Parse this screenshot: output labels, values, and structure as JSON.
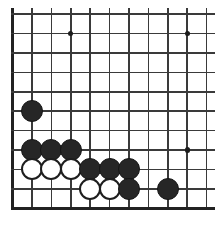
{
  "figure": {
    "width": 215,
    "height": 231,
    "background_color": "#ffffff"
  },
  "board": {
    "name": "go-board",
    "description": "Partial Go board, lower-left corner region, cropped on right and top",
    "line_color": "#3a3a3a",
    "edge_color": "#222222",
    "cell_size": 19.4,
    "origin_x": 12.6,
    "origin_y": 14.2,
    "columns": 11,
    "rows": 11,
    "left_edge_index": 0,
    "bottom_edge_index": 10,
    "vertical_lines_x": [
      12.6,
      32.0,
      51.4,
      70.8,
      90.2,
      109.6,
      129.0,
      148.4,
      167.8,
      187.2,
      206.6
    ],
    "horizontal_lines_y": [
      14.2,
      33.6,
      53.0,
      72.4,
      91.8,
      111.2,
      130.6,
      150.0,
      169.4,
      188.8,
      208.2
    ],
    "horizontal_line_right_extent": 215,
    "vertical_line_top_extent": 8,
    "star_points": [
      {
        "name": "star-point-upper-left",
        "col": 3,
        "row": 1,
        "x": 70.8,
        "y": 33.6
      },
      {
        "name": "star-point-upper-right",
        "col": 9,
        "row": 1,
        "x": 187.2,
        "y": 33.6
      },
      {
        "name": "star-point-lower-right",
        "col": 9,
        "row": 7,
        "x": 187.2,
        "y": 150.0
      }
    ],
    "stone_diameter": 22,
    "stones": [
      {
        "color": "black",
        "col": 1,
        "row": 5,
        "x": 32.0,
        "y": 111.2,
        "label": "black-stone-b1-r5"
      },
      {
        "color": "black",
        "col": 1,
        "row": 7,
        "x": 32.0,
        "y": 150.0,
        "label": "black-stone-b1-r7"
      },
      {
        "color": "black",
        "col": 2,
        "row": 7,
        "x": 51.4,
        "y": 150.0,
        "label": "black-stone-b2-r7"
      },
      {
        "color": "black",
        "col": 3,
        "row": 7,
        "x": 70.8,
        "y": 150.0,
        "label": "black-stone-b3-r7"
      },
      {
        "color": "white",
        "col": 1,
        "row": 8,
        "x": 32.0,
        "y": 169.4,
        "label": "white-stone-w1-r8"
      },
      {
        "color": "white",
        "col": 2,
        "row": 8,
        "x": 51.4,
        "y": 169.4,
        "label": "white-stone-w2-r8"
      },
      {
        "color": "white",
        "col": 3,
        "row": 8,
        "x": 70.8,
        "y": 169.4,
        "label": "white-stone-w3-r8"
      },
      {
        "color": "black",
        "col": 4,
        "row": 8,
        "x": 90.2,
        "y": 169.4,
        "label": "black-stone-b4-r8"
      },
      {
        "color": "black",
        "col": 5,
        "row": 8,
        "x": 109.6,
        "y": 169.4,
        "label": "black-stone-b5-r8"
      },
      {
        "color": "black",
        "col": 6,
        "row": 8,
        "x": 129.0,
        "y": 169.4,
        "label": "black-stone-b6-r8"
      },
      {
        "color": "white",
        "col": 4,
        "row": 9,
        "x": 90.2,
        "y": 188.8,
        "label": "white-stone-w4-r9"
      },
      {
        "color": "white",
        "col": 5,
        "row": 9,
        "x": 109.6,
        "y": 188.8,
        "label": "white-stone-w5-r9"
      },
      {
        "color": "black",
        "col": 6,
        "row": 9,
        "x": 129.0,
        "y": 188.8,
        "label": "black-stone-b6-r9"
      },
      {
        "color": "black",
        "col": 8,
        "row": 9,
        "x": 167.8,
        "y": 188.8,
        "label": "black-stone-b8-r9"
      }
    ],
    "counts": {
      "black_stones": 9,
      "white_stones": 5,
      "total_stones": 14
    }
  }
}
